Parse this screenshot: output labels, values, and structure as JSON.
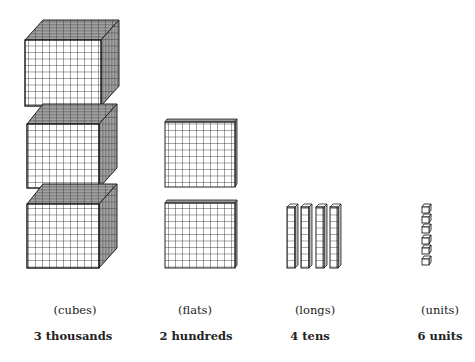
{
  "diagram": {
    "groups": [
      {
        "name": "cubes",
        "category_label": "(cubes)",
        "count_label": "3 thousands",
        "count": 3,
        "place": "thousands"
      },
      {
        "name": "flats",
        "category_label": "(flats)",
        "count_label": "2 hundreds",
        "count": 2,
        "place": "hundreds"
      },
      {
        "name": "longs",
        "category_label": "(longs)",
        "count_label": "4 tens",
        "count": 4,
        "place": "tens"
      },
      {
        "name": "units",
        "category_label": "(units)",
        "count_label": "6 units",
        "count": 6,
        "place": "units"
      }
    ],
    "colors": {
      "line": "#222222",
      "shade": "#9a9a9a",
      "background": "#ffffff"
    }
  }
}
